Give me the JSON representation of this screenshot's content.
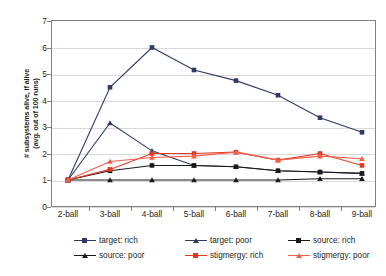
{
  "chart_data": {
    "type": "line",
    "title": "",
    "xlabel": "",
    "ylabel": "# subsystems alive, if alive (avg. out of 100 runs)",
    "ylabel_line1": "# subsystems alive, if alive",
    "ylabel_line2": "(avg. out of 100 runs)",
    "categories": [
      "2-ball",
      "3-ball",
      "4-ball",
      "5-ball",
      "6-ball",
      "7-ball",
      "8-ball",
      "9-ball"
    ],
    "ylim": [
      0,
      7
    ],
    "yticks": [
      0,
      1,
      2,
      3,
      4,
      5,
      6,
      7
    ],
    "grid": "horizontal",
    "legend_position": "bottom",
    "series": [
      {
        "name": "target: rich",
        "color": "#2e3a68",
        "marker": "square",
        "values": [
          1.0,
          4.5,
          6.0,
          5.15,
          4.75,
          4.2,
          3.35,
          2.8
        ]
      },
      {
        "name": "target: poor",
        "color": "#2e3a68",
        "marker": "triangle",
        "values": [
          1.0,
          3.15,
          2.1,
          1.55,
          1.5,
          1.35,
          1.3,
          1.25
        ]
      },
      {
        "name": "source: rich",
        "color": "#1a1a1a",
        "marker": "square",
        "values": [
          1.0,
          1.35,
          1.55,
          1.55,
          1.5,
          1.35,
          1.3,
          1.25
        ]
      },
      {
        "name": "source: poor",
        "color": "#1a1a1a",
        "marker": "triangle",
        "values": [
          1.0,
          1.0,
          1.0,
          1.0,
          1.0,
          1.0,
          1.05,
          1.05
        ]
      },
      {
        "name": "stigmergy: rich",
        "color": "#e03a23",
        "marker": "square",
        "values": [
          1.0,
          1.4,
          2.0,
          2.0,
          2.05,
          1.75,
          2.0,
          1.55
        ]
      },
      {
        "name": "stigmergy: poor",
        "color": "#f0604a",
        "marker": "triangle",
        "values": [
          1.0,
          1.7,
          1.85,
          1.9,
          2.05,
          1.75,
          1.9,
          1.8
        ]
      }
    ]
  },
  "legend": {
    "entries": [
      {
        "label": "target: rich"
      },
      {
        "label": "target: poor"
      },
      {
        "label": "source: rich"
      },
      {
        "label": "source: poor"
      },
      {
        "label": "stigmergy: rich"
      },
      {
        "label": "stigmergy: poor"
      }
    ]
  }
}
